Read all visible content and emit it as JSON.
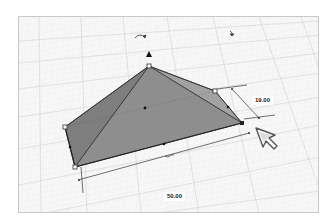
{
  "viewport": {
    "background": "#f6f6f6",
    "grid_color": "#d8d8d8",
    "shape_fill": "#8c8c8c"
  },
  "dimensions": {
    "depth_label": "19.00",
    "width_label": "50.00"
  },
  "controls": {
    "rotate_icon": "rotate-arrow",
    "rotate_icon_2": "rotate-arrow",
    "lift_icon": "up-arrow"
  }
}
